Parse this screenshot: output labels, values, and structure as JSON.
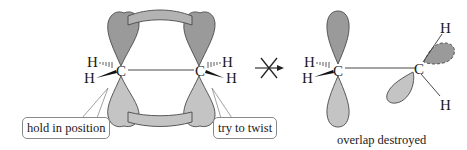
{
  "diagram": {
    "colors": {
      "lobe_dark": "#9a9a9a",
      "lobe_light": "#c4c4c4",
      "overlap_band": "#b3b3b3",
      "stroke": "#4a4a4a",
      "text": "#1a1a1a"
    },
    "left_structure": {
      "atoms": {
        "c_left": "C",
        "c_right": "C",
        "h_left_top": "H",
        "h_left_bottom": "H",
        "h_right_top": "H",
        "h_right_bottom": "H"
      },
      "callouts": {
        "hold": "hold in position",
        "twist": "try to twist"
      }
    },
    "arrow": {
      "symbol": "crossed-out reaction arrow",
      "meaning": "does not occur"
    },
    "right_structure": {
      "atoms": {
        "c_left": "C",
        "c_right": "C",
        "h_left_top": "H",
        "h_left_bottom": "H",
        "h_right_top": "H",
        "h_right_bottom": "H"
      },
      "caption": "overlap destroyed"
    }
  }
}
